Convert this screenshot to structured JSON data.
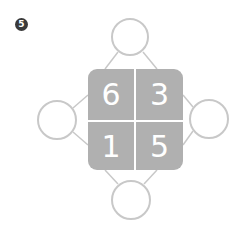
{
  "problem": {
    "number": "5"
  },
  "grid": {
    "cells": [
      {
        "position": "top-left",
        "value": "6"
      },
      {
        "position": "top-right",
        "value": "3"
      },
      {
        "position": "bottom-left",
        "value": "1"
      },
      {
        "position": "bottom-right",
        "value": "5"
      }
    ],
    "fill_color": "#b0b0b0",
    "text_color": "#ffffff"
  },
  "answer_circles": [
    {
      "position": "top",
      "value": ""
    },
    {
      "position": "left",
      "value": ""
    },
    {
      "position": "right",
      "value": ""
    },
    {
      "position": "bottom",
      "value": ""
    }
  ],
  "colors": {
    "circle_stroke": "#c8c8c8",
    "badge": "#3a3a3a"
  }
}
